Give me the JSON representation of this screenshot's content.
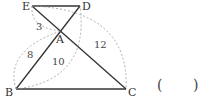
{
  "diagram": {
    "points": {
      "E": {
        "label": "E",
        "x": 32,
        "y": 6
      },
      "D": {
        "label": "D",
        "x": 80,
        "y": 6
      },
      "A": {
        "label": "A",
        "x": 61,
        "y": 31
      },
      "B": {
        "label": "B",
        "x": 16,
        "y": 89
      },
      "C": {
        "label": "C",
        "x": 126,
        "y": 89
      }
    },
    "segments": [
      [
        "E",
        "D"
      ],
      [
        "E",
        "C"
      ],
      [
        "D",
        "B"
      ],
      [
        "B",
        "C"
      ]
    ],
    "measurements": {
      "EA": "3",
      "BA": "8",
      "BD": "10",
      "EC": "12"
    }
  },
  "answer": {
    "open_paren": "(",
    "close_paren": ")"
  }
}
